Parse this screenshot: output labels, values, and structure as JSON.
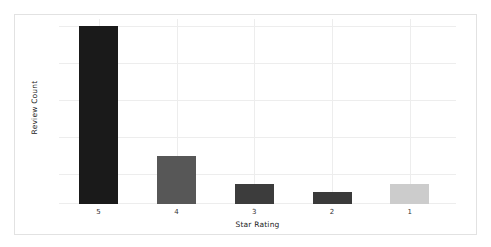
{
  "figure": {
    "background": "#ffffff",
    "border_color": "#e2e2e2",
    "grid_color": "#ededed"
  },
  "axes": {
    "xlabel": "Star Rating",
    "ylabel": "Review Count",
    "tick_labels": [
      "5",
      "4",
      "3",
      "2",
      "1"
    ]
  },
  "chart_data": {
    "type": "bar",
    "title": "",
    "subtitle": "",
    "xlabel": "Star Rating",
    "ylabel": "Review Count",
    "categories": [
      "5",
      "4",
      "3",
      "2",
      "1"
    ],
    "values": [
      100,
      27,
      11,
      7,
      11
    ],
    "bar_colors": [
      "#1a1a1a",
      "#575757",
      "#3c3c3c",
      "#3a3a3a",
      "#cccccc"
    ],
    "bar_pixel_heights": [
      178,
      48,
      20,
      12,
      20
    ],
    "ylim": [
      0,
      185
    ],
    "y_tick_labels": [],
    "grid": {
      "horizontal": true,
      "vertical": true,
      "horizontal_positions_pct": [
        4,
        24,
        44,
        64,
        84
      ],
      "vertical_at_categories": true
    },
    "legend": null,
    "legend_position": "none",
    "annotations": []
  },
  "bars": [
    {
      "category": "5",
      "value": 100,
      "color": "#1a1a1a",
      "height_pct": 96.2,
      "center_pct": 10
    },
    {
      "category": "4",
      "value": 27,
      "color": "#575757",
      "height_pct": 25.9,
      "center_pct": 29.6
    },
    {
      "category": "3",
      "value": 11,
      "color": "#3c3c3c",
      "height_pct": 10.8,
      "center_pct": 49.2
    },
    {
      "category": "2",
      "value": 7,
      "color": "#3a3a3a",
      "height_pct": 6.5,
      "center_pct": 68.8
    },
    {
      "category": "1",
      "value": 11,
      "color": "#cccccc",
      "height_pct": 10.8,
      "center_pct": 88.4
    }
  ]
}
